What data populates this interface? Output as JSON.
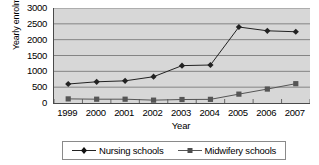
{
  "chart_data": {
    "type": "line",
    "title": "",
    "xlabel": "Year",
    "ylabel": "Yearly enrolment",
    "categories": [
      "1999",
      "2000",
      "2001",
      "2002",
      "2003",
      "2004",
      "2005",
      "2006",
      "2007"
    ],
    "yticks": [
      "0",
      "500",
      "1000",
      "1500",
      "2000",
      "2500",
      "3000"
    ],
    "ylim": [
      0,
      3000
    ],
    "grid": true,
    "legend_position": "bottom",
    "series": [
      {
        "name": "Nursing schools",
        "marker": "diamond",
        "color": "#222222",
        "values": [
          600,
          670,
          700,
          830,
          1180,
          1200,
          2400,
          2280,
          2250
        ]
      },
      {
        "name": "Midwifery schools",
        "marker": "square",
        "color": "#555555",
        "values": [
          130,
          120,
          120,
          90,
          110,
          115,
          280,
          440,
          610
        ]
      }
    ]
  },
  "legend": {
    "items": [
      {
        "label": "Nursing schools"
      },
      {
        "label": "Midwifery schools"
      }
    ]
  }
}
